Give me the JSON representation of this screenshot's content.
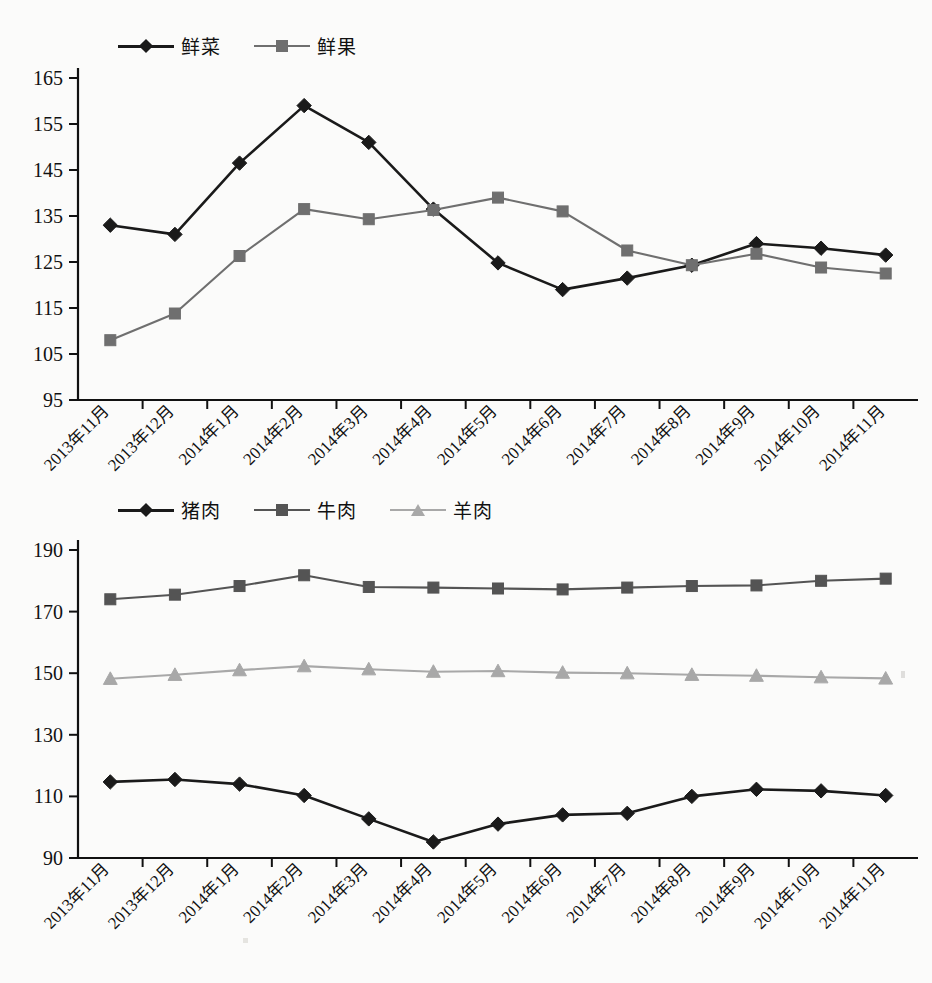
{
  "page": {
    "background_color": "#fbfbfa",
    "text_color": "#111111"
  },
  "charts": [
    {
      "id": "fresh-produce",
      "legend_position": "top-left",
      "series_colors": {
        "fresh_vegetables": "#1a1a1a",
        "fresh_fruit": "#6f6f6f"
      },
      "legend": [
        {
          "label": "鲜菜",
          "marker": "diamond",
          "color": "#1a1a1a"
        },
        {
          "label": "鲜果",
          "marker": "square",
          "color": "#6f6f6f"
        }
      ]
    },
    {
      "id": "meat",
      "legend_position": "top-left",
      "series_colors": {
        "pork": "#1a1a1a",
        "beef": "#545454",
        "mutton": "#a8a8a8"
      },
      "legend": [
        {
          "label": "猪肉",
          "marker": "diamond",
          "color": "#1a1a1a"
        },
        {
          "label": "牛肉",
          "marker": "square",
          "color": "#545454"
        },
        {
          "label": "羊肉",
          "marker": "triangle",
          "color": "#a8a8a8"
        }
      ]
    }
  ],
  "chart_data": [
    {
      "type": "line",
      "title": "",
      "xlabel": "",
      "ylabel": "",
      "ylim": [
        95,
        165
      ],
      "ytick_step": 10,
      "yticks": [
        95,
        105,
        115,
        125,
        135,
        145,
        155,
        165
      ],
      "grid": false,
      "legend_position": "top-left",
      "categories": [
        "2013年11月",
        "2013年12月",
        "2014年1月",
        "2014年2月",
        "2014年3月",
        "2014年4月",
        "2014年5月",
        "2014年6月",
        "2014年7月",
        "2014年8月",
        "2014年9月",
        "2014年10月",
        "2014年11月"
      ],
      "series": [
        {
          "name": "鲜菜",
          "marker": "diamond",
          "color": "#1a1a1a",
          "values": [
            133,
            131,
            146.5,
            159,
            151,
            136.5,
            124.8,
            119,
            121.5,
            124.3,
            129,
            128,
            126.5
          ]
        },
        {
          "name": "鲜果",
          "marker": "square",
          "color": "#6f6f6f",
          "values": [
            108,
            113.8,
            126.3,
            136.5,
            134.3,
            136.3,
            139,
            136,
            127.5,
            124.3,
            126.8,
            123.8,
            122.5
          ]
        }
      ]
    },
    {
      "type": "line",
      "title": "",
      "xlabel": "",
      "ylabel": "",
      "ylim": [
        90,
        190
      ],
      "ytick_step": 20,
      "yticks": [
        90,
        110,
        130,
        150,
        170,
        190
      ],
      "grid": false,
      "legend_position": "top-left",
      "categories": [
        "2013年11月",
        "2013年12月",
        "2014年1月",
        "2014年2月",
        "2014年3月",
        "2014年4月",
        "2014年5月",
        "2014年6月",
        "2014年7月",
        "2014年8月",
        "2014年9月",
        "2014年10月",
        "2014年11月"
      ],
      "series": [
        {
          "name": "猪肉",
          "marker": "diamond",
          "color": "#1a1a1a",
          "values": [
            114.7,
            115.5,
            114,
            110.3,
            102.7,
            95.2,
            101,
            104,
            104.5,
            110,
            112.3,
            111.8,
            110.3
          ]
        },
        {
          "name": "牛肉",
          "marker": "square",
          "color": "#545454",
          "values": [
            174,
            175.5,
            178.3,
            181.8,
            178,
            177.8,
            177.5,
            177.2,
            177.8,
            178.3,
            178.5,
            180,
            180.7
          ]
        },
        {
          "name": "羊肉",
          "marker": "triangle",
          "color": "#a8a8a8",
          "values": [
            148.2,
            149.5,
            151,
            152.3,
            151.3,
            150.5,
            150.7,
            150.2,
            150,
            149.5,
            149.2,
            148.7,
            148.3
          ]
        }
      ]
    }
  ]
}
